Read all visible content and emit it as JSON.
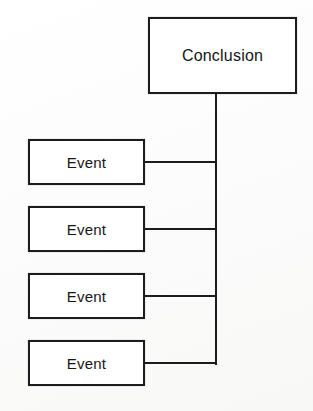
{
  "diagram": {
    "type": "tree",
    "stroke_color": "#1c1c1c",
    "node_fill": "#ffffff",
    "background_color": "#fdfdfd",
    "root": {
      "id": "conclusion",
      "label": "Conclusion"
    },
    "children": [
      {
        "id": "event-1",
        "label": "Event"
      },
      {
        "id": "event-2",
        "label": "Event"
      },
      {
        "id": "event-3",
        "label": "Event"
      },
      {
        "id": "event-4",
        "label": "Event"
      }
    ],
    "edges": [
      {
        "from": "event-1",
        "to": "conclusion"
      },
      {
        "from": "event-2",
        "to": "conclusion"
      },
      {
        "from": "event-3",
        "to": "conclusion"
      },
      {
        "from": "event-4",
        "to": "conclusion"
      }
    ]
  }
}
